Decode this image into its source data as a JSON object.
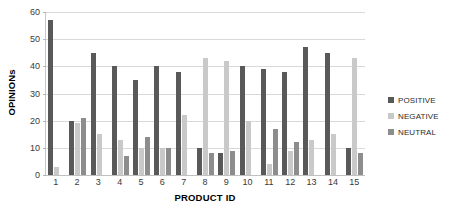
{
  "chart_data": {
    "type": "bar",
    "title": "",
    "xlabel": "PRODUCT ID",
    "ylabel": "OPINIONs",
    "ylim": [
      0,
      60
    ],
    "yticks": [
      0,
      10,
      20,
      30,
      40,
      50,
      60
    ],
    "grid": true,
    "legend_position": "right",
    "categories": [
      "1",
      "2",
      "3",
      "4",
      "5",
      "6",
      "7",
      "8",
      "9",
      "10",
      "11",
      "12",
      "13",
      "14",
      "15"
    ],
    "series": [
      {
        "name": "POSITIVE",
        "color": "#595959",
        "values": [
          57,
          20,
          45,
          40,
          35,
          40,
          38,
          10,
          8,
          40,
          39,
          38,
          47,
          45,
          10
        ]
      },
      {
        "name": "NEGATIVE",
        "color": "#c9c9c9",
        "values": [
          3,
          19,
          15,
          13,
          10,
          10,
          22,
          43,
          42,
          20,
          4,
          9,
          13,
          15,
          43
        ]
      },
      {
        "name": "NEUTRAL",
        "color": "#8d8d8d",
        "values": [
          0,
          21,
          0,
          7,
          14,
          10,
          0,
          8,
          9,
          0,
          17,
          12,
          0,
          0,
          8
        ]
      }
    ]
  },
  "legend": {
    "items": [
      {
        "label": "POSITIVE",
        "color": "#595959"
      },
      {
        "label": "NEGATIVE",
        "color": "#c9c9c9"
      },
      {
        "label": "NEUTRAL",
        "color": "#8d8d8d"
      }
    ]
  }
}
